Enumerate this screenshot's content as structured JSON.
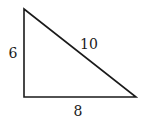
{
  "diagram": {
    "type": "right-triangle",
    "vertices": {
      "top": [
        24,
        9
      ],
      "bottom_left": [
        24,
        97
      ],
      "bottom_right": [
        136,
        97
      ]
    },
    "sides": {
      "vertical": {
        "label": "6"
      },
      "hypotenuse": {
        "label": "10"
      },
      "base": {
        "label": "8"
      }
    },
    "stroke_color": "#1a1a1a",
    "background": "#ffffff"
  }
}
